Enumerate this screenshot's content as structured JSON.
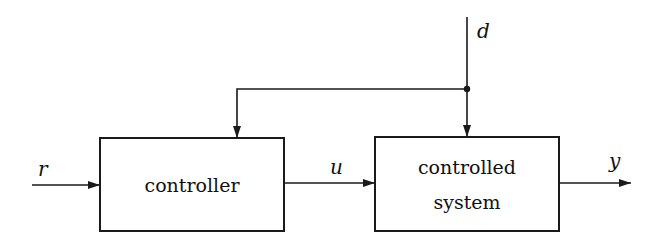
{
  "diagram": {
    "type": "block-diagram",
    "blocks": [
      {
        "id": "controller",
        "label_lines": [
          "controller"
        ],
        "x": 100,
        "y": 138,
        "w": 184,
        "h": 93
      },
      {
        "id": "controlled_system",
        "label_lines": [
          "controlled",
          "system"
        ],
        "x": 375,
        "y": 137,
        "w": 184,
        "h": 94
      }
    ],
    "signals": {
      "r": {
        "label": "r",
        "role": "reference input"
      },
      "u": {
        "label": "u",
        "role": "control signal"
      },
      "y": {
        "label": "y",
        "role": "output"
      },
      "d": {
        "label": "d",
        "role": "disturbance"
      }
    },
    "edges": [
      {
        "from": "input",
        "to": "controller",
        "label": "r"
      },
      {
        "from": "controller",
        "to": "controlled_system",
        "label": "u"
      },
      {
        "from": "controlled_system",
        "to": "output",
        "label": "y"
      },
      {
        "from": "disturbance",
        "to": "controlled_system",
        "label": "d"
      },
      {
        "from": "d-junction",
        "to": "controller",
        "label": ""
      }
    ],
    "colors": {
      "line": "#1a1a1a",
      "background": "#ffffff"
    }
  }
}
